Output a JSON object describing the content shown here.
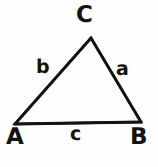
{
  "figure": {
    "kind": "geometry-diagram",
    "shape": "triangle",
    "background_color": "#fefefe",
    "ink_color": "#15120f",
    "stroke_width_px": 2.6,
    "width_px": 158,
    "height_px": 167
  },
  "vertices": [
    {
      "id": "C",
      "label": "C",
      "x": 91,
      "y": 38,
      "label_x": 76,
      "label_y": 4,
      "position": "apex-top"
    },
    {
      "id": "A",
      "label": "A",
      "x": 15,
      "y": 124,
      "label_x": 6,
      "label_y": 126,
      "position": "bottom-left"
    },
    {
      "id": "B",
      "label": "B",
      "x": 141,
      "y": 122,
      "label_x": 130,
      "label_y": 126,
      "position": "bottom-right"
    }
  ],
  "sides": [
    {
      "id": "a",
      "label": "a",
      "from": "C",
      "to": "B",
      "label_x": 116,
      "label_y": 60,
      "position": "right"
    },
    {
      "id": "b",
      "label": "b",
      "from": "A",
      "to": "C",
      "label_x": 36,
      "label_y": 58,
      "position": "left"
    },
    {
      "id": "c",
      "label": "c",
      "from": "A",
      "to": "B",
      "label_x": 70,
      "label_y": 125,
      "position": "bottom"
    }
  ],
  "path": {
    "outline_points": "91,38 141,122 15,124 91,38"
  }
}
